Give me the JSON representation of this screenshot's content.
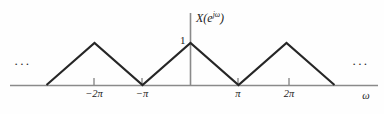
{
  "figure": {
    "signal_label": "X(e",
    "signal_label_exponent": "jω",
    "signal_label_close": ")",
    "amplitude_label": "1",
    "omega_axis_label": "ω",
    "ellipsis_left": "···",
    "ellipsis_right": "···",
    "line_color": "#262626",
    "axis_color": "#808080",
    "background_color": "#fefefe"
  },
  "ticks": {
    "neg_two_pi": "−2π",
    "neg_pi": "−π",
    "pi": "π",
    "two_pi": "2π"
  },
  "chart_data": {
    "type": "line",
    "xlabel": "ω",
    "ylabel": "X(e^{jω})",
    "xlim": [
      -3.0,
      3.0
    ],
    "ylim": [
      0,
      1.15
    ],
    "grid": false,
    "legend": null,
    "x_tick_values": [
      -2,
      -1,
      1,
      2
    ],
    "x_tick_labels": [
      "−2π",
      "−π",
      "π",
      "2π"
    ],
    "y_tick_values": [
      1
    ],
    "y_tick_labels": [
      "1"
    ],
    "series": [
      {
        "name": "X(e^{jω})",
        "x": [
          -3,
          -2,
          -1,
          0,
          1,
          2,
          3
        ],
        "y": [
          0,
          1,
          0,
          1,
          0,
          1,
          0
        ],
        "x_units": "π radians/sample",
        "color": "#262626"
      }
    ],
    "annotations": [
      {
        "text": "···",
        "x": -3.35,
        "y": 0.45
      },
      {
        "text": "···",
        "x": 3.35,
        "y": 0.45
      },
      {
        "text": "1",
        "x": -0.17,
        "y": 1.0
      }
    ]
  }
}
